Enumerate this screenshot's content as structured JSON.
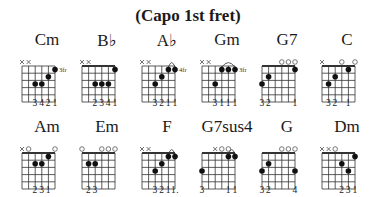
{
  "title": "(Capo 1st fret)",
  "chords": [
    {
      "name": "Cm",
      "fret_label": "3fr",
      "barre": false,
      "top": [
        "x",
        "x",
        "",
        "",
        "",
        ""
      ],
      "dots": [
        [
          3,
          3
        ],
        [
          4,
          3
        ],
        [
          5,
          2
        ],
        [
          6,
          1
        ]
      ],
      "arc": null,
      "fingers": [
        "",
        "",
        "3",
        "4",
        "2",
        "1"
      ]
    },
    {
      "name": "B♭",
      "fret_label": "",
      "barre": true,
      "top": [
        "x",
        "x",
        "",
        "",
        "",
        ""
      ],
      "dots": [
        [
          3,
          3
        ],
        [
          4,
          3
        ],
        [
          5,
          3
        ],
        [
          6,
          1
        ]
      ],
      "arc": null,
      "fingers": [
        "",
        "",
        "2",
        "3",
        "4",
        "1"
      ]
    },
    {
      "name": "A♭",
      "fret_label": "4fr",
      "barre": false,
      "top": [
        "x",
        "x",
        "",
        "",
        "",
        ""
      ],
      "dots": [
        [
          3,
          3
        ],
        [
          4,
          2
        ],
        [
          5,
          1
        ],
        [
          6,
          1
        ]
      ],
      "arc": [
        5,
        6
      ],
      "fingers": [
        "",
        "",
        "3",
        "2",
        "1",
        "1"
      ]
    },
    {
      "name": "Gm",
      "fret_label": "3fr",
      "barre": false,
      "top": [
        "x",
        "x",
        "",
        "",
        "",
        ""
      ],
      "dots": [
        [
          3,
          3
        ],
        [
          4,
          1
        ],
        [
          5,
          1
        ],
        [
          6,
          1
        ]
      ],
      "arc": [
        4,
        6
      ],
      "fingers": [
        "",
        "",
        "3",
        "1",
        "1",
        "1"
      ]
    },
    {
      "name": "G7",
      "fret_label": "",
      "barre": true,
      "top": [
        "",
        "",
        "",
        "o",
        "o",
        "o"
      ],
      "dots": [
        [
          1,
          3
        ],
        [
          2,
          2
        ],
        [
          6,
          1
        ]
      ],
      "arc": null,
      "fingers": [
        "3",
        "2",
        "",
        "",
        "",
        "1"
      ]
    },
    {
      "name": "C",
      "fret_label": "",
      "barre": true,
      "top": [
        "x",
        "",
        "",
        "o",
        "",
        "o"
      ],
      "dots": [
        [
          2,
          3
        ],
        [
          3,
          2
        ],
        [
          5,
          1
        ]
      ],
      "arc": null,
      "fingers": [
        "",
        "3",
        "2",
        "",
        "1",
        ""
      ]
    },
    {
      "name": "Am",
      "fret_label": "",
      "barre": true,
      "top": [
        "x",
        "o",
        "",
        "",
        "",
        "o"
      ],
      "dots": [
        [
          3,
          2
        ],
        [
          4,
          2
        ],
        [
          5,
          1
        ]
      ],
      "arc": null,
      "fingers": [
        "",
        "",
        "2",
        "3",
        "1",
        ""
      ]
    },
    {
      "name": "Em",
      "fret_label": "",
      "barre": true,
      "top": [
        "o",
        "",
        "",
        "o",
        "o",
        "o"
      ],
      "dots": [
        [
          2,
          2
        ],
        [
          3,
          2
        ]
      ],
      "arc": null,
      "fingers": [
        "",
        "2",
        "3",
        "",
        "",
        ""
      ]
    },
    {
      "name": "F",
      "fret_label": "",
      "barre": true,
      "top": [
        "x",
        "x",
        "",
        "",
        "",
        ""
      ],
      "dots": [
        [
          3,
          3
        ],
        [
          4,
          2
        ],
        [
          5,
          1
        ],
        [
          6,
          1
        ]
      ],
      "arc": [
        5,
        6
      ],
      "fingers": [
        "",
        "",
        "3",
        "2",
        "1",
        "1."
      ]
    },
    {
      "name": "G7sus4",
      "fret_label": "",
      "barre": true,
      "top": [
        "",
        "",
        "x",
        "o",
        "o",
        ""
      ],
      "dots": [
        [
          1,
          3
        ],
        [
          5,
          1
        ],
        [
          6,
          1
        ]
      ],
      "arc": [
        5,
        6
      ],
      "fingers": [
        "3",
        "",
        "",
        "",
        "1",
        "1"
      ]
    },
    {
      "name": "G",
      "fret_label": "",
      "barre": true,
      "top": [
        "",
        "",
        "",
        "o",
        "o",
        "o"
      ],
      "dots": [
        [
          1,
          3
        ],
        [
          2,
          2
        ],
        [
          6,
          3
        ]
      ],
      "arc": null,
      "fingers": [
        "3",
        "2",
        "",
        "",
        "",
        "4"
      ]
    },
    {
      "name": "Dm",
      "fret_label": "",
      "barre": true,
      "top": [
        "x",
        "x",
        "o",
        "",
        "",
        ""
      ],
      "dots": [
        [
          4,
          2
        ],
        [
          5,
          3
        ],
        [
          6,
          1
        ]
      ],
      "arc": null,
      "fingers": [
        "",
        "",
        "",
        "2",
        "3",
        "1"
      ]
    }
  ]
}
